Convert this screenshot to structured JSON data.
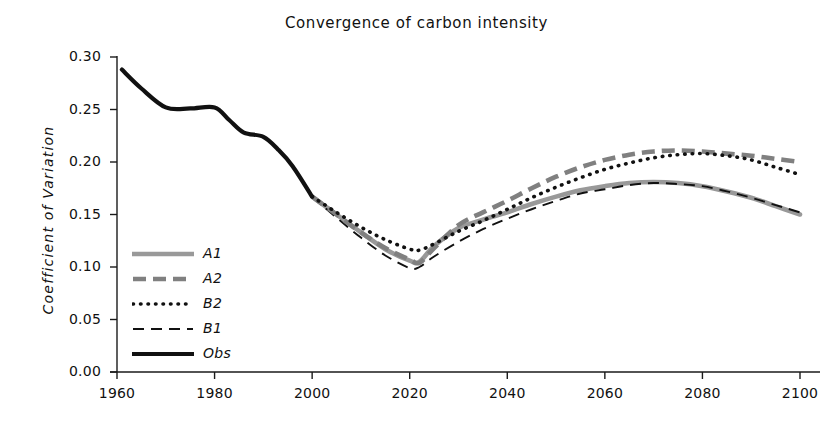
{
  "chart_data": {
    "type": "line",
    "title": "Convergence of carbon intensity",
    "xlabel": "",
    "ylabel": "Coefficient of Variation",
    "xlim": [
      1960,
      2100
    ],
    "ylim": [
      0.0,
      0.3
    ],
    "xticks": [
      "1960",
      "1980",
      "2000",
      "2020",
      "2040",
      "2060",
      "2080",
      "2100"
    ],
    "xtick_values": [
      1960,
      1980,
      2000,
      2020,
      2040,
      2060,
      2080,
      2100
    ],
    "yticks": [
      "0.00",
      "0.05",
      "0.10",
      "0.15",
      "0.20",
      "0.25",
      "0.30"
    ],
    "ytick_values": [
      0.0,
      0.05,
      0.1,
      0.15,
      0.2,
      0.25,
      0.3
    ],
    "grid": false,
    "legend_position": "inside-lower-left",
    "series": [
      {
        "name": "A1",
        "style": "solid-thick-gray",
        "color": "#999999",
        "x": [
          2000,
          2005,
          2010,
          2015,
          2020,
          2022,
          2025,
          2030,
          2035,
          2040,
          2045,
          2050,
          2055,
          2060,
          2065,
          2070,
          2075,
          2080,
          2085,
          2090,
          2095,
          2100
        ],
        "y": [
          0.167,
          0.15,
          0.133,
          0.117,
          0.106,
          0.105,
          0.12,
          0.137,
          0.145,
          0.152,
          0.16,
          0.167,
          0.173,
          0.177,
          0.18,
          0.181,
          0.18,
          0.177,
          0.172,
          0.166,
          0.158,
          0.15
        ]
      },
      {
        "name": "A2",
        "style": "dashed-thick-gray",
        "color": "#808080",
        "x": [
          2000,
          2005,
          2010,
          2015,
          2020,
          2022,
          2025,
          2030,
          2035,
          2040,
          2045,
          2050,
          2055,
          2060,
          2065,
          2070,
          2075,
          2080,
          2085,
          2090,
          2095,
          2100
        ],
        "y": [
          0.167,
          0.15,
          0.133,
          0.118,
          0.107,
          0.104,
          0.118,
          0.14,
          0.152,
          0.163,
          0.175,
          0.186,
          0.195,
          0.202,
          0.207,
          0.21,
          0.211,
          0.21,
          0.208,
          0.206,
          0.203,
          0.2
        ]
      },
      {
        "name": "B2",
        "style": "dotted-black",
        "color": "#111111",
        "x": [
          2000,
          2005,
          2010,
          2015,
          2020,
          2022,
          2025,
          2030,
          2035,
          2040,
          2045,
          2050,
          2055,
          2060,
          2065,
          2070,
          2075,
          2080,
          2085,
          2090,
          2095,
          2100
        ],
        "y": [
          0.167,
          0.152,
          0.138,
          0.126,
          0.117,
          0.116,
          0.122,
          0.134,
          0.144,
          0.155,
          0.166,
          0.176,
          0.185,
          0.193,
          0.199,
          0.204,
          0.207,
          0.208,
          0.206,
          0.202,
          0.195,
          0.188
        ]
      },
      {
        "name": "B1",
        "style": "dashed-thin-black",
        "color": "#111111",
        "x": [
          2000,
          2005,
          2010,
          2015,
          2020,
          2022,
          2025,
          2030,
          2035,
          2040,
          2045,
          2050,
          2055,
          2060,
          2065,
          2070,
          2075,
          2080,
          2085,
          2090,
          2095,
          2100
        ],
        "y": [
          0.167,
          0.147,
          0.128,
          0.111,
          0.099,
          0.1,
          0.11,
          0.124,
          0.136,
          0.146,
          0.155,
          0.163,
          0.17,
          0.174,
          0.178,
          0.18,
          0.179,
          0.177,
          0.172,
          0.166,
          0.159,
          0.152
        ]
      },
      {
        "name": "Obs",
        "style": "solid-thick-black",
        "color": "#111111",
        "x": [
          1961,
          1965,
          1970,
          1975,
          1980,
          1983,
          1986,
          1990,
          1993,
          1996,
          2000
        ],
        "y": [
          0.288,
          0.27,
          0.252,
          0.251,
          0.252,
          0.24,
          0.228,
          0.224,
          0.212,
          0.196,
          0.167
        ]
      }
    ],
    "legend": [
      {
        "label": "A1",
        "style": "solid-thick-gray",
        "color": "#999999"
      },
      {
        "label": "A2",
        "style": "dashed-thick-gray",
        "color": "#808080"
      },
      {
        "label": "B2",
        "style": "dotted-black",
        "color": "#111111"
      },
      {
        "label": "B1",
        "style": "dashed-thin-black",
        "color": "#111111"
      },
      {
        "label": "Obs",
        "style": "solid-thick-black",
        "color": "#111111"
      }
    ]
  }
}
